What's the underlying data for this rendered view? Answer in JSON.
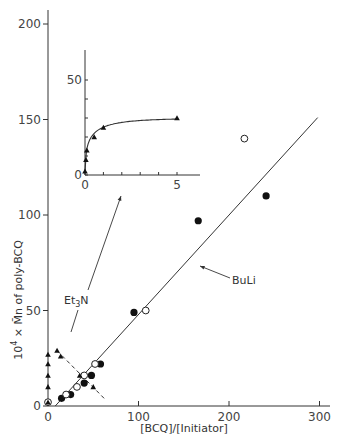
{
  "chart_data": [
    {
      "id": "main",
      "type": "scatter",
      "title": "",
      "xlabel": "[BCQ]/[Initiator]",
      "ylabel": "10^4 × Mn of poly-BCQ",
      "xlim": [
        0,
        310
      ],
      "ylim": [
        0,
        210
      ],
      "xticks": [
        0,
        100,
        200,
        300
      ],
      "yticks": [
        0,
        50,
        100,
        150,
        200
      ],
      "grid": false,
      "series": [
        {
          "name": "BuLi (filled circles)",
          "marker": "filled-circle",
          "points": [
            [
              15,
              4
            ],
            [
              25,
              6
            ],
            [
              40,
              12
            ],
            [
              48,
              16
            ],
            [
              58,
              22
            ],
            [
              95,
              49
            ],
            [
              166,
              97
            ],
            [
              241,
              110
            ]
          ]
        },
        {
          "name": "BuLi (open circles)",
          "marker": "open-circle",
          "points": [
            [
              0,
              2
            ],
            [
              20,
              6
            ],
            [
              32,
              10
            ],
            [
              40,
              16
            ],
            [
              52,
              22
            ],
            [
              108,
              50
            ],
            [
              217,
              140
            ]
          ]
        },
        {
          "name": "Et3N (triangles)",
          "marker": "filled-triangle",
          "points": [
            [
              0,
              2
            ],
            [
              0,
              10
            ],
            [
              0,
              16
            ],
            [
              0,
              22
            ],
            [
              0,
              27
            ],
            [
              10,
              29
            ],
            [
              14,
              26
            ],
            [
              35,
              16
            ],
            [
              50,
              10
            ]
          ]
        }
      ],
      "fit_lines": [
        {
          "name": "BuLi",
          "style": "solid",
          "from": [
            8,
            0
          ],
          "to": [
            298,
            151
          ]
        },
        {
          "name": "Et3N",
          "style": "dashed",
          "from": [
            10,
            29
          ],
          "to": [
            62,
            4
          ]
        }
      ],
      "annotations": [
        {
          "text": "BuLi",
          "at": [
            205,
            65
          ],
          "arrow_to": [
            165,
            76
          ]
        },
        {
          "text": "Et3N",
          "at": [
            33,
            55
          ],
          "arrow_to": [
            82,
            110
          ],
          "second_arrow_to": [
            28,
            40
          ]
        }
      ]
    },
    {
      "id": "inset",
      "type": "line",
      "title": "",
      "xlabel": "",
      "ylabel": "",
      "xlim": [
        0,
        6
      ],
      "ylim": [
        0,
        60
      ],
      "xticks": [
        0,
        1,
        2,
        3,
        4,
        5
      ],
      "xtick_labels": [
        "0",
        "",
        "",
        "",
        "",
        "5"
      ],
      "yticks": [
        0,
        10,
        20,
        30,
        40,
        50
      ],
      "ytick_labels": [
        "0",
        "",
        "",
        "",
        "",
        "50"
      ],
      "series": [
        {
          "name": "Et3N",
          "marker": "filled-triangle",
          "points": [
            [
              0,
              2
            ],
            [
              0.05,
              8
            ],
            [
              0.1,
              13
            ],
            [
              0.5,
              20
            ],
            [
              1,
              25
            ],
            [
              5,
              30
            ]
          ]
        }
      ]
    }
  ],
  "labels": {
    "x_axis_title": "[BCQ]/[Initiator]",
    "y_axis_title_prefix": "10",
    "y_axis_title_sup": "4",
    "y_axis_title_rest": " × M̄n of poly-BCQ",
    "buli": "BuLi",
    "et3n_main": "Et",
    "et3n_sub": "3",
    "et3n_end": "N"
  }
}
